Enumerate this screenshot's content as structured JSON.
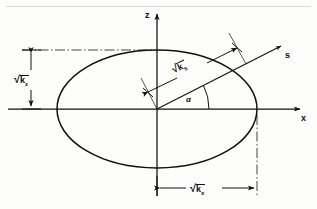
{
  "figure": {
    "type": "geometric-diagram",
    "background_color": "#fdfdfb",
    "line_color": "#111111"
  },
  "axes": {
    "vertical": {
      "name": "z-axis",
      "label": "z",
      "arrow": "up"
    },
    "horizontal": {
      "name": "x-axis",
      "label": "x",
      "arrow": "right"
    },
    "origin": {
      "x": 157,
      "y": 109
    }
  },
  "ellipse": {
    "name": "anisotropy-ellipse",
    "center_x": 157,
    "center_y": 109,
    "semi_axis_x": 100,
    "semi_axis_z": 59
  },
  "labels": {
    "vertical_dimension": {
      "radical": "√",
      "base": "k",
      "subscript": "z"
    },
    "horizontal_dimension": {
      "radical": "√",
      "base": "k",
      "subscript": "x"
    },
    "inclined_dimension": {
      "radical": "√",
      "base": "k",
      "subscript": "s"
    },
    "direction_vector": "s",
    "angle": "α"
  },
  "dimension_lines": {
    "vertical": {
      "name": "sqrt-kz-dimension",
      "from_y": 50,
      "to_y": 109,
      "at_x": 31,
      "arrows": "both"
    },
    "horizontal": {
      "name": "sqrt-kx-dimension",
      "from_x": 157,
      "to_x": 257,
      "at_y": 188,
      "arrows": "both"
    },
    "inclined": {
      "name": "sqrt-ks-dimension",
      "angle_deg": 27,
      "arrows": "both"
    }
  },
  "ray": {
    "name": "s-direction-ray",
    "angle_deg": 27,
    "arrow": "end"
  }
}
